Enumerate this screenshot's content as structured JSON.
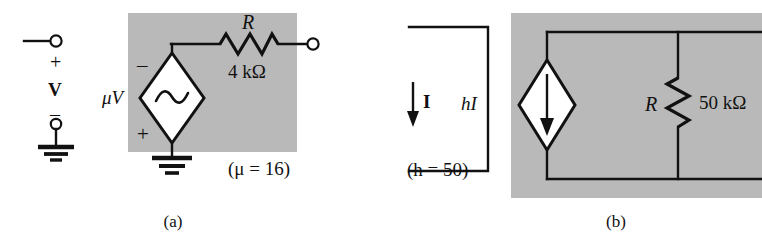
{
  "figure": {
    "background_color": "#ffffff",
    "shade_color": "#b9b9b9",
    "line_color": "#111111"
  },
  "panel_a": {
    "caption": "(a)",
    "input_port": {
      "plus_label": "+",
      "minus_label": "–",
      "voltage_label": "V"
    },
    "source": {
      "label": "μV",
      "top_sign": "–",
      "bottom_sign": "+",
      "symbol": "sine-wave"
    },
    "resistor": {
      "name": "R",
      "value": "4 kΩ"
    },
    "annotation": "(μ = 16)"
  },
  "panel_b": {
    "caption": "(b)",
    "current_label": "I",
    "source": {
      "label": "hI",
      "symbol": "down-arrow"
    },
    "resistor": {
      "name": "R",
      "value": "50 kΩ"
    },
    "annotation": "(h = 50)"
  }
}
